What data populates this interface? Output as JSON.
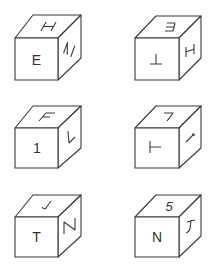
{
  "figure": {
    "line_color": "#3a3a3a",
    "text_color": "#333333",
    "background": "#ffffff"
  },
  "cubes": [
    {
      "id": "cube-1",
      "row": 1,
      "col": 1,
      "front": {
        "label": "E",
        "rotation": 0,
        "mirror": false
      },
      "top": {
        "label": "H",
        "rotation": -20,
        "mirror": false,
        "note": "slanted H"
      },
      "right": {
        "label": "H",
        "rotation": 90,
        "mirror": false,
        "note": "H rotated sideways"
      }
    },
    {
      "id": "cube-2",
      "row": 1,
      "col": 2,
      "front": {
        "label": "T",
        "rotation": 180,
        "mirror": false,
        "note": "upside-down T"
      },
      "top": {
        "label": "E",
        "rotation": 180,
        "mirror": false,
        "note": "inverted E"
      },
      "right": {
        "label": "H",
        "rotation": -90,
        "mirror": false,
        "note": "H rotated sideways"
      }
    },
    {
      "id": "cube-3",
      "row": 2,
      "col": 1,
      "front": {
        "label": "1",
        "rotation": 0,
        "mirror": false
      },
      "top": {
        "label": "F",
        "rotation": 0,
        "mirror": false,
        "note": "slanted F"
      },
      "right": {
        "label": "L",
        "rotation": 0,
        "mirror": false,
        "note": "L shape"
      }
    },
    {
      "id": "cube-4",
      "row": 2,
      "col": 2,
      "front": {
        "label": "T",
        "rotation": 90,
        "mirror": false,
        "note": "T rotated sideways"
      },
      "top": {
        "label": "7",
        "rotation": 0,
        "mirror": false
      },
      "right": {
        "label": "1",
        "rotation": 45,
        "mirror": false,
        "note": "diagonal 1"
      }
    },
    {
      "id": "cube-5",
      "row": 3,
      "col": 1,
      "front": {
        "label": "T",
        "rotation": 0,
        "mirror": false
      },
      "top": {
        "label": "J",
        "rotation": 90,
        "mirror": false,
        "note": "J rotated"
      },
      "right": {
        "label": "N",
        "rotation": 0,
        "mirror": false
      }
    },
    {
      "id": "cube-6",
      "row": 3,
      "col": 2,
      "front": {
        "label": "N",
        "rotation": 0,
        "mirror": false
      },
      "top": {
        "label": "5",
        "rotation": 0,
        "mirror": false
      },
      "right": {
        "label": "1",
        "rotation": 180,
        "mirror": false,
        "note": "inverted 1"
      }
    }
  ]
}
